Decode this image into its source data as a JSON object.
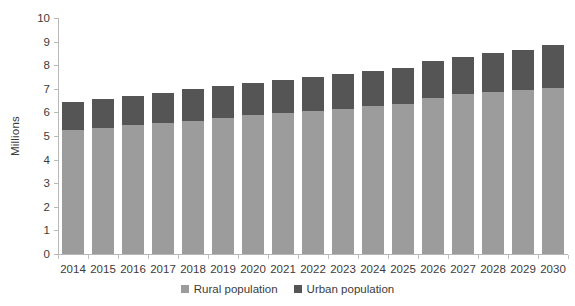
{
  "chart_data": {
    "type": "bar",
    "subtype": "stacked-vertical",
    "title": "",
    "xlabel": "",
    "ylabel": "Millions",
    "ylim": [
      0,
      10
    ],
    "ytick_step": 1,
    "yticks": [
      10,
      9,
      8,
      7,
      6,
      5,
      4,
      3,
      2,
      1,
      0
    ],
    "grid": false,
    "legend_position": "bottom-center",
    "categories": [
      "2014",
      "2015",
      "2016",
      "2017",
      "2018",
      "2019",
      "2020",
      "2021",
      "2022",
      "2023",
      "2024",
      "2025",
      "2026",
      "2027",
      "2028",
      "2029",
      "2030"
    ],
    "series": [
      {
        "name": "Rural population",
        "color": "#9c9c9c",
        "values": [
          5.25,
          5.35,
          5.48,
          5.55,
          5.65,
          5.78,
          5.88,
          5.97,
          6.06,
          6.15,
          6.26,
          6.35,
          6.62,
          6.76,
          6.88,
          6.96,
          7.03
        ]
      },
      {
        "name": "Urban population",
        "color": "#555555",
        "values": [
          1.18,
          1.2,
          1.2,
          1.27,
          1.33,
          1.33,
          1.36,
          1.39,
          1.43,
          1.46,
          1.48,
          1.52,
          1.54,
          1.58,
          1.64,
          1.69,
          1.82
        ]
      }
    ],
    "totals": [
      6.43,
      6.55,
      6.68,
      6.82,
      6.98,
      7.11,
      7.24,
      7.36,
      7.49,
      7.61,
      7.74,
      7.87,
      8.16,
      8.34,
      8.52,
      8.65,
      8.85
    ]
  },
  "legend": {
    "items": [
      {
        "label": "Rural population",
        "color": "#9c9c9c"
      },
      {
        "label": "Urban population",
        "color": "#555555"
      }
    ]
  },
  "axes": {
    "y_title": "Millions"
  }
}
